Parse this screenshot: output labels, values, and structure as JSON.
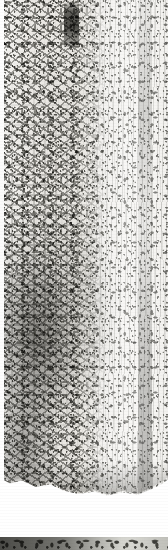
{
  "document": {
    "kind": "scanned-image-plate",
    "caption": "",
    "alt_text": "Grayscale scan of a weathered inscribed stone surface; dense angular carved strokes on the left half, lighter mottled speckled surface on the right half."
  },
  "canvas": {
    "width": 168,
    "height": 550,
    "background_color": "#ffffff"
  },
  "main_plate": {
    "name": "inscription-plate",
    "top": 0,
    "height": 506,
    "paper_color": "#f3f2ef",
    "ink_color": "#3a3a35",
    "regions": [
      {
        "name": "left-inscription-zone",
        "description": "dense dark angular branching carved strokes",
        "x_start": 0,
        "x_end": 108,
        "tone": "dark"
      },
      {
        "name": "right-speckle-zone",
        "description": "lighter mottled vertical streaky speckle",
        "x_start": 108,
        "x_end": 168,
        "tone": "light"
      }
    ],
    "features": [
      {
        "name": "dark-vertical-bar",
        "x": 64,
        "y": 3,
        "width": 15,
        "height": 44,
        "color": "#3c3c36"
      },
      {
        "name": "dark-cluster",
        "x": 0,
        "y": 230,
        "width": 100,
        "height": 270,
        "color": "#2f2f2a"
      },
      {
        "name": "right-edge-streak",
        "x": 138,
        "y": 0,
        "width": 14,
        "height": 506,
        "color": "#4a4a44"
      },
      {
        "name": "left-white-margin",
        "x": 0,
        "y": 0,
        "width": 4,
        "height": 506,
        "color": "#ffffff"
      }
    ],
    "bottom_edge": "irregular curved torn edge"
  },
  "plate_gap": {
    "name": "white-separator-gap",
    "top": 506,
    "height": 31,
    "color": "#ffffff"
  },
  "bottom_strip": {
    "name": "next-plate-top-edge",
    "top": 537,
    "height": 13,
    "description": "mottled dark gray band, darker at left and lighter toward the right",
    "color_left": "#8e8e88",
    "color_right": "#e2e2dc"
  },
  "colors": {
    "paper": "#f3f2ef",
    "ink_dark": "#3a3a35",
    "ink_mid": "#5a5a54",
    "white": "#ffffff",
    "strip_dark": "#8e8e88"
  }
}
